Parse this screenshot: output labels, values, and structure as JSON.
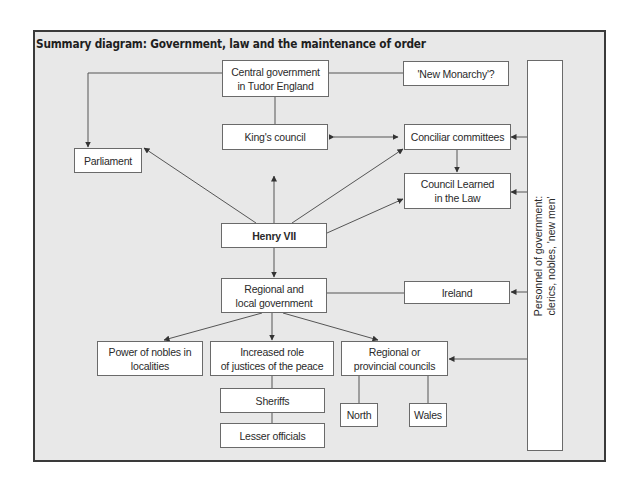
{
  "diagram": {
    "title": "Summary diagram: Government, law and the maintenance of order",
    "nodes": {
      "central_government": {
        "line1": "Central government",
        "line2": "in Tudor England"
      },
      "new_monarchy": {
        "label": "'New Monarchy'?"
      },
      "parliament": {
        "label": "Parliament"
      },
      "kings_council": {
        "label": "King's council"
      },
      "conciliar_committees": {
        "label": "Conciliar committees"
      },
      "council_learned": {
        "line1": "Council Learned",
        "line2": "in the Law"
      },
      "henry_vii": {
        "label": "Henry VII"
      },
      "regional_local": {
        "line1": "Regional and",
        "line2": "local government"
      },
      "ireland": {
        "label": "Ireland"
      },
      "power_of_nobles": {
        "line1": "Power of nobles in",
        "line2": "localities"
      },
      "justices_of_peace": {
        "line1": "Increased role",
        "line2": "of justices of the peace"
      },
      "regional_councils": {
        "line1": "Regional or",
        "line2": "provincial councils"
      },
      "sheriffs": {
        "label": "Sheriffs"
      },
      "lesser_officials": {
        "label": "Lesser officials"
      },
      "north": {
        "label": "North"
      },
      "wales": {
        "label": "Wales"
      },
      "personnel": {
        "line1": "Personnel of government:",
        "line2": "clerics, nobles, 'new men'"
      }
    },
    "edges": [
      {
        "from": "Central government in Tudor England",
        "to": "Parliament",
        "type": "arrow"
      },
      {
        "from": "Central government in Tudor England",
        "to": "King's council",
        "type": "arrow"
      },
      {
        "from": "Central government in Tudor England",
        "to": "'New Monarchy'?",
        "type": "line"
      },
      {
        "from": "King's council",
        "to": "Conciliar committees",
        "type": "double-arrow"
      },
      {
        "from": "Conciliar committees",
        "to": "Council Learned in the Law",
        "type": "arrow"
      },
      {
        "from": "Henry VII",
        "to": "Parliament",
        "type": "arrow"
      },
      {
        "from": "Henry VII",
        "to": "King's council",
        "type": "arrow"
      },
      {
        "from": "Henry VII",
        "to": "Conciliar committees",
        "type": "arrow"
      },
      {
        "from": "Henry VII",
        "to": "Council Learned in the Law",
        "type": "arrow"
      },
      {
        "from": "Henry VII",
        "to": "Regional and local government",
        "type": "arrow"
      },
      {
        "from": "Regional and local government",
        "to": "Ireland",
        "type": "line"
      },
      {
        "from": "Regional and local government",
        "to": "Power of nobles in localities",
        "type": "arrow"
      },
      {
        "from": "Regional and local government",
        "to": "Increased role of justices of the peace",
        "type": "arrow"
      },
      {
        "from": "Regional and local government",
        "to": "Regional or provincial councils",
        "type": "arrow"
      },
      {
        "from": "Increased role of justices of the peace",
        "to": "Sheriffs",
        "type": "line"
      },
      {
        "from": "Sheriffs",
        "to": "Lesser officials",
        "type": "line"
      },
      {
        "from": "Regional or provincial councils",
        "to": "North",
        "type": "line"
      },
      {
        "from": "Regional or provincial councils",
        "to": "Wales",
        "type": "line"
      },
      {
        "from": "Personnel of government",
        "to": "Conciliar committees",
        "type": "arrow"
      },
      {
        "from": "Personnel of government",
        "to": "Council Learned in the Law",
        "type": "arrow"
      },
      {
        "from": "Personnel of government",
        "to": "Ireland",
        "type": "arrow"
      },
      {
        "from": "Personnel of government",
        "to": "Regional or provincial councils",
        "type": "arrow"
      }
    ]
  },
  "colors": {
    "background": "#e8e8e8",
    "frame_border": "#3a3a3a",
    "box_fill": "#ffffff",
    "box_border": "#6a6a6a",
    "line": "#444444",
    "text": "#2a2a2a"
  }
}
